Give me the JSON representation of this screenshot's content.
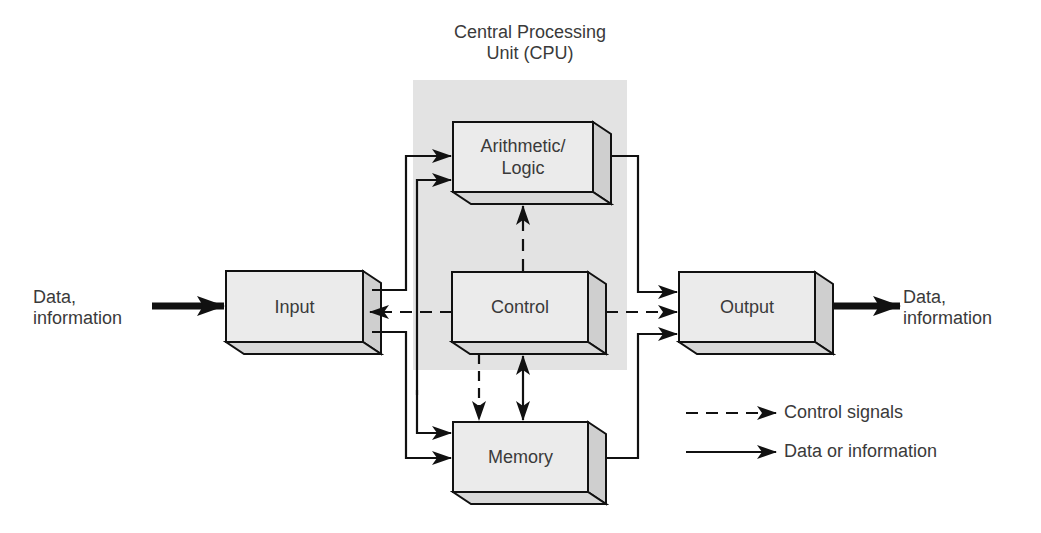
{
  "title": {
    "line1": "Central Processing",
    "line2": "Unit (CPU)"
  },
  "colors": {
    "cpu_region": "#e3e3e3",
    "box_front": "#ebebeb",
    "box_side": "#cfcfcf",
    "box_bottom": "#d8d8d8",
    "line": "#111111",
    "text": "#3a3a3a"
  },
  "boxes": {
    "arithmetic_logic": {
      "line1": "Arithmetic/",
      "line2": "Logic"
    },
    "control": {
      "label": "Control"
    },
    "input": {
      "label": "Input"
    },
    "memory": {
      "label": "Memory"
    },
    "output": {
      "label": "Output"
    }
  },
  "external": {
    "in": {
      "line1": "Data,",
      "line2": "information"
    },
    "out": {
      "line1": "Data,",
      "line2": "information"
    }
  },
  "legend": {
    "items": [
      {
        "style": "dashed",
        "label": "Control signals"
      },
      {
        "style": "solid",
        "label": "Data or information"
      }
    ]
  }
}
